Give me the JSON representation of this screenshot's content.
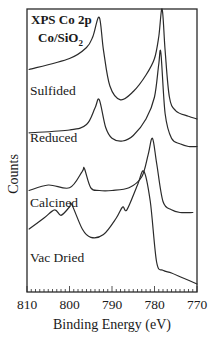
{
  "chart_data": {
    "type": "line",
    "title": "XPS Co 2p",
    "subtitle": "Co/SiO2",
    "subtitle_main": "Co/SiO",
    "subtitle_sub": "2",
    "xlabel": "Binding Energy  (eV)",
    "ylabel": "Counts",
    "xlim": [
      810,
      770
    ],
    "x_reversed": true,
    "x_ticks": [
      810,
      800,
      790,
      780,
      770
    ],
    "x_tick_labels": [
      "810",
      "800",
      "790",
      "780",
      "770"
    ],
    "minor_tick_step": 1,
    "y_ticks": [],
    "grid": false,
    "legend": "inline labels",
    "series": [
      {
        "name": "Sulfided",
        "label_pos": [
          30,
          95
        ],
        "x": [
          809.5,
          800,
          796,
          794.5,
          793,
          792,
          790.5,
          788,
          785,
          782,
          780,
          779,
          778.2,
          777.5,
          776.5,
          775,
          772,
          770
        ],
        "y": [
          0.78,
          0.82,
          0.86,
          0.9,
          0.97,
          0.85,
          0.72,
          0.67,
          0.7,
          0.76,
          0.82,
          0.9,
          1.0,
          0.85,
          0.68,
          0.63,
          0.61,
          0.6
        ],
        "peaks_eV": [
          793,
          778.2
        ]
      },
      {
        "name": "Reduced",
        "label_pos": [
          30,
          142
        ],
        "x": [
          809.5,
          800,
          796,
          794,
          793,
          791.5,
          790,
          787.5,
          785,
          782,
          780,
          779,
          778.5,
          777.5,
          776,
          774,
          772,
          770
        ],
        "y": [
          0.55,
          0.56,
          0.58,
          0.64,
          0.67,
          0.57,
          0.53,
          0.52,
          0.54,
          0.6,
          0.68,
          0.8,
          0.84,
          0.62,
          0.53,
          0.51,
          0.5,
          0.5
        ],
        "peaks_eV": [
          793,
          778.5
        ]
      },
      {
        "name": "Calcined",
        "label_pos": [
          30,
          207
        ],
        "x": [
          809.5,
          805,
          800,
          797,
          796.5,
          795,
          793,
          790,
          786,
          783,
          781.5,
          780.5,
          779.5,
          778,
          776,
          774,
          771
        ],
        "y": [
          0.34,
          0.36,
          0.35,
          0.41,
          0.42,
          0.35,
          0.34,
          0.34,
          0.35,
          0.39,
          0.47,
          0.53,
          0.44,
          0.3,
          0.27,
          0.26,
          0.26
        ],
        "peaks_eV": [
          796.5,
          780.5
        ]
      },
      {
        "name": "Vac Dried",
        "label_pos": [
          30,
          262
        ],
        "x": [
          809.5,
          806,
          803.5,
          802,
          800,
          799.5,
          797,
          795,
          792,
          789,
          787.5,
          786.5,
          784,
          782.5,
          781,
          779.5,
          778,
          776,
          773,
          770
        ],
        "y": [
          0.2,
          0.24,
          0.27,
          0.25,
          0.28,
          0.29,
          0.2,
          0.17,
          0.18,
          0.24,
          0.28,
          0.27,
          0.36,
          0.41,
          0.3,
          0.08,
          0.05,
          0.04,
          0.02,
          0.0
        ],
        "peaks_eV": [
          803.5,
          799.5,
          787.5,
          782.5
        ]
      }
    ]
  }
}
